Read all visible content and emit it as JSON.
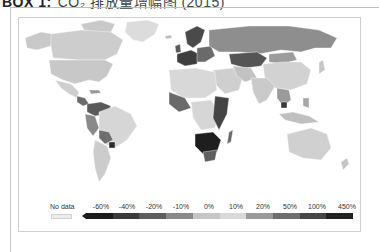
{
  "header": {
    "title": "BOX 1:",
    "subtitle": "CO₂ 排放量增幅图 (2015)"
  },
  "map": {
    "colors": {
      "no_data": "#ececec",
      "ocean": "#ffffff",
      "border": "#ffffff"
    }
  },
  "legend": {
    "no_data_label": "No data",
    "bins": [
      {
        "label": "-60%",
        "color": "#1c1c1c"
      },
      {
        "label": "-40%",
        "color": "#3a3a3a"
      },
      {
        "label": "-20%",
        "color": "#5e5e5e"
      },
      {
        "label": "-10%",
        "color": "#8a8a8a"
      },
      {
        "label": "0%",
        "color": "#c6c6c6"
      },
      {
        "label": "10%",
        "color": "#d9d9d9"
      },
      {
        "label": "20%",
        "color": "#9a9a9a"
      },
      {
        "label": "50%",
        "color": "#6e6e6e"
      },
      {
        "label": "100%",
        "color": "#464646"
      },
      {
        "label": "450%",
        "color": "#222222"
      }
    ]
  }
}
